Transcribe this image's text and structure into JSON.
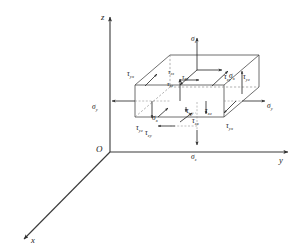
{
  "figure": {
    "background_color": "#ffffff",
    "line_color": "#3a3a3a",
    "hidden_line_color": "#7d7d7d",
    "label_color": "#141414"
  },
  "axes": {
    "origin_label": "O",
    "z_label": "z",
    "y_label": "y",
    "x_label": "x"
  },
  "labels": {
    "sigma_z_top": {
      "base": "σ",
      "sub": "z"
    },
    "sigma_z_bottom": {
      "base": "σ",
      "sub": "z"
    },
    "sigma_y_left": {
      "base": "σ",
      "sub": "y"
    },
    "sigma_y_right": {
      "base": "σ",
      "sub": "y"
    },
    "sigma_x_top": {
      "base": "σ",
      "sub": "x"
    },
    "sigma_x_bottom": {
      "base": "σ",
      "sub": "x"
    },
    "tau_zy_top": {
      "base": "τ",
      "sub": "zy"
    },
    "tau_zx_top": {
      "base": "τ",
      "sub": "zx"
    },
    "tau_xy_topmid": {
      "base": "τ",
      "sub": "xy"
    },
    "tau_xz_topmid": {
      "base": "τ",
      "sub": "xz"
    },
    "tau_yx_left": {
      "base": "τ",
      "sub": "yx"
    },
    "tau_yz_left": {
      "base": "τ",
      "sub": "yz"
    },
    "tau_yz_right": {
      "base": "τ",
      "sub": "yz"
    },
    "tau_yx_right": {
      "base": "τ",
      "sub": "yx"
    },
    "tau_xy_bottom": {
      "base": "τ",
      "sub": "xy"
    },
    "tau_xz_bottom": {
      "base": "τ",
      "sub": "xz"
    },
    "tau_zx_bottom": {
      "base": "τ",
      "sub": "zx"
    },
    "tau_zy_bottom": {
      "base": "τ",
      "sub": "zy"
    }
  }
}
